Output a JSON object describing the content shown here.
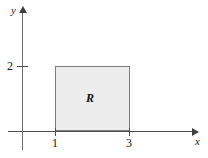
{
  "chart_data": {
    "type": "area",
    "title": "",
    "subtitle": "",
    "xlabel": "x",
    "ylabel": "y",
    "xlim": [
      -0.35,
      4.6
    ],
    "ylim": [
      -0.55,
      3.7
    ],
    "grid": false,
    "legend": null,
    "x_ticks": [
      {
        "value": 1,
        "label": "1"
      },
      {
        "value": 3,
        "label": "3"
      }
    ],
    "y_ticks": [
      {
        "value": 2,
        "label": "2"
      }
    ],
    "regions": [
      {
        "name": "R",
        "label": "R",
        "shape": "rectangle",
        "x_min": 1,
        "x_max": 3,
        "y_min": 0,
        "y_max": 2,
        "fill_color": "#ececec",
        "border_color": "#7d7d7d",
        "area": 4
      }
    ],
    "annotations": [
      {
        "text": "R",
        "x": 2,
        "y": 1
      }
    ],
    "axis_style": {
      "arrows": true,
      "axis_color": "#4d4d4d",
      "label_color": "#111111"
    }
  },
  "figure": {
    "x_axis_name": "x",
    "y_axis_name": "y",
    "region_label": "R",
    "y_tick_2": "2",
    "x_tick_1": "1",
    "x_tick_3": "3"
  }
}
